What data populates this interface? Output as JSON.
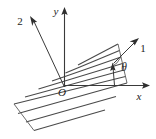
{
  "figure": {
    "background_color": "#ffffff",
    "line_color": "#3a3a3a",
    "labels": {
      "x_axis": "x",
      "y_axis": "y",
      "axis_1": "1",
      "axis_2": "2",
      "origin": "O",
      "angle": "θ"
    },
    "elements": {
      "x_axis_name": "x-axis",
      "y_axis_name": "y-axis",
      "material_axis_1_name": "material-axis-1",
      "material_axis_2_name": "material-axis-2",
      "band_name": "hatched-fiber-band",
      "angle_arc_name": "theta-angle-arc",
      "origin_marker_name": "origin-marker"
    },
    "geometry": {
      "origin": {
        "x": 64,
        "y": 86
      },
      "x_axis_end": {
        "x": 150,
        "y": 86
      },
      "y_axis_end": {
        "x": 64,
        "y": 7
      },
      "axis1_tip": {
        "x": 139,
        "y": 38
      },
      "axis2_tip": {
        "x": 30,
        "y": 16
      },
      "hatch_count": 9,
      "hatch_angle_deg": 28
    }
  }
}
